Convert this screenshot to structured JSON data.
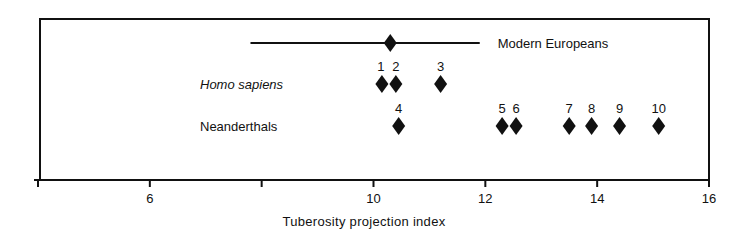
{
  "chart_data": {
    "type": "scatter",
    "title": "",
    "xlabel": "Tuberosity projection index",
    "ylabel": "",
    "xlim": [
      4,
      16
    ],
    "x_ticks": [
      {
        "value": 4,
        "label": ""
      },
      {
        "value": 6,
        "label": "6"
      },
      {
        "value": 8,
        "label": ""
      },
      {
        "value": 10,
        "label": "10"
      },
      {
        "value": 12,
        "label": "12"
      },
      {
        "value": 14,
        "label": "14"
      },
      {
        "value": 16,
        "label": "16"
      }
    ],
    "grid": false,
    "legend": "none",
    "marker": "diamond",
    "series": [
      {
        "name": "Modern Europeans",
        "label_style": "normal",
        "mean": 10.3,
        "range": [
          7.8,
          11.9
        ],
        "points": [
          {
            "label": "",
            "x": 10.3
          }
        ]
      },
      {
        "name": "Homo sapiens",
        "label_style": "italic",
        "points": [
          {
            "label": "1",
            "x": 10.15
          },
          {
            "label": "2",
            "x": 10.4
          },
          {
            "label": "3",
            "x": 11.2
          }
        ]
      },
      {
        "name": "Neanderthals",
        "label_style": "normal",
        "points": [
          {
            "label": "4",
            "x": 10.45
          },
          {
            "label": "5",
            "x": 12.3
          },
          {
            "label": "6",
            "x": 12.55
          },
          {
            "label": "7",
            "x": 13.5
          },
          {
            "label": "8",
            "x": 13.9
          },
          {
            "label": "9",
            "x": 14.4
          },
          {
            "label": "10",
            "x": 15.1
          }
        ]
      }
    ]
  },
  "colors": {
    "ink": "#111111",
    "background": "#ffffff"
  }
}
